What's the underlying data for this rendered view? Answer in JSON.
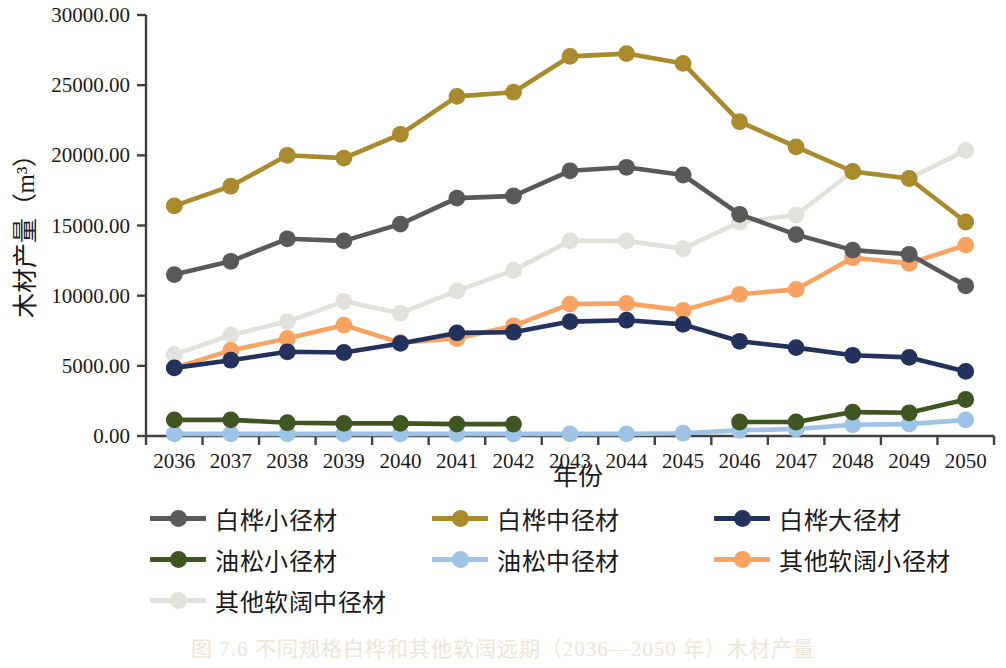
{
  "caption": "图 7.6  不同规格白桦和其他软阔远期（2036—2050 年）木材产量",
  "axes": {
    "ylabel": "木材产量（m³）",
    "xlabel": "年份",
    "ytick_labels": [
      "0.00",
      "5000.00",
      "10000.00",
      "15000.00",
      "20000.00",
      "25000.00",
      "30000.00"
    ]
  },
  "legend": {
    "rows": [
      [
        {
          "label": "白桦小径材",
          "color": "#595959",
          "name": "legend-item-birch-small"
        },
        {
          "label": "白桦中径材",
          "color": "#A98A2C",
          "name": "legend-item-birch-medium"
        },
        {
          "label": "白桦大径材",
          "color": "#22325C",
          "name": "legend-item-birch-large"
        }
      ],
      [
        {
          "label": "油松小径材",
          "color": "#3F5623",
          "name": "legend-item-pine-small"
        },
        {
          "label": "油松中径材",
          "color": "#9DC3E6",
          "name": "legend-item-pine-medium"
        },
        {
          "label": "其他软阔小径材",
          "color": "#F8A361",
          "name": "legend-item-other-small"
        }
      ],
      [
        {
          "label": "其他软阔中径材",
          "color": "#E2E1DC",
          "name": "legend-item-other-medium"
        }
      ]
    ]
  },
  "chart_data": {
    "type": "line",
    "title": "",
    "xlabel": "年份",
    "ylabel": "木材产量（m³）",
    "ylim": [
      0,
      30000
    ],
    "ytick_step": 5000,
    "grid": false,
    "legend_position": "bottom",
    "categories": [
      2036,
      2037,
      2038,
      2039,
      2040,
      2041,
      2042,
      2043,
      2044,
      2045,
      2046,
      2047,
      2048,
      2049,
      2050
    ],
    "series": [
      {
        "name": "白桦小径材",
        "color": "#595959",
        "values": [
          11500,
          12450,
          14050,
          13900,
          15100,
          16950,
          17100,
          18900,
          19150,
          18600,
          15800,
          14350,
          13250,
          12950,
          10700
        ]
      },
      {
        "name": "白桦中径材",
        "color": "#A98A2C",
        "values": [
          16400,
          17800,
          20000,
          19800,
          21500,
          24200,
          24500,
          27050,
          27250,
          26550,
          22400,
          20600,
          18850,
          18350,
          15250
        ]
      },
      {
        "name": "白桦大径材",
        "color": "#22325C",
        "values": [
          4850,
          5400,
          6000,
          5950,
          6600,
          7350,
          7400,
          8150,
          8250,
          7950,
          6750,
          6300,
          5750,
          5600,
          4600
        ]
      },
      {
        "name": "油松小径材",
        "color": "#3F5623",
        "values": [
          1150,
          1150,
          950,
          900,
          900,
          850,
          850,
          null,
          null,
          null,
          1000,
          1000,
          1700,
          1650,
          2600
        ]
      },
      {
        "name": "油松中径材",
        "color": "#9DC3E6",
        "values": [
          150,
          150,
          150,
          150,
          150,
          150,
          150,
          150,
          150,
          200,
          400,
          500,
          800,
          850,
          1150
        ]
      },
      {
        "name": "其他软阔小径材",
        "color": "#F8A361",
        "values": [
          4850,
          6100,
          6950,
          7900,
          6650,
          6950,
          7850,
          9400,
          9450,
          8950,
          10100,
          10450,
          12700,
          12300,
          13600
        ]
      },
      {
        "name": "其他软阔中径材",
        "color": "#E2E1DC",
        "values": [
          5800,
          7200,
          8150,
          9600,
          8750,
          10350,
          11800,
          13900,
          13900,
          13350,
          15250,
          15750,
          18850,
          18350,
          20350
        ]
      }
    ]
  }
}
